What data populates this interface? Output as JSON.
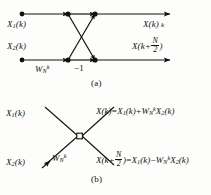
{
  "figure": {
    "type": "fft-butterfly-signal-flow-graph",
    "ink_color": "#111111",
    "background_color": "#fdfdfb"
  },
  "panel_a": {
    "caption": "(a)",
    "inputs": [
      {
        "name": "input-top",
        "base": "X",
        "sub": "1",
        "arg": "(k)"
      },
      {
        "name": "input-bottom",
        "base": "X",
        "sub": "2",
        "arg": "(k)"
      }
    ],
    "outputs": [
      {
        "name": "output-top",
        "base": "X",
        "arg": "(k)",
        "trailing": "k"
      },
      {
        "name": "output-bottom",
        "base": "X",
        "arg_prefix": "(k+",
        "num": "N",
        "den": "2",
        "arg_suffix": ")"
      }
    ],
    "twiddle": {
      "base": "W",
      "sub": "N",
      "sup": "k"
    },
    "minus_one": "−1",
    "nodes": 4
  },
  "panel_b": {
    "caption": "(b)",
    "inputs": [
      {
        "name": "input-top",
        "base": "X",
        "sub": "1",
        "arg": "(k)"
      },
      {
        "name": "input-bottom",
        "base": "X",
        "sub": "2",
        "arg": "(k)"
      }
    ],
    "twiddle": {
      "base": "W",
      "sub": "N",
      "sup": "k"
    },
    "equation_top": {
      "lhs_base": "X",
      "lhs_arg": "(k)",
      "eq": "=",
      "t1_base": "X",
      "t1_sub": "1",
      "t1_arg": "(k)",
      "sign": "+",
      "t2_base": "W",
      "t2_sub": "N",
      "t2_sup": "k",
      "t3_base": "X",
      "t3_sub": "2",
      "t3_arg": "(k)"
    },
    "equation_bottom": {
      "lhs_base": "X",
      "lhs_prefix": "(k+",
      "lhs_num": "N",
      "lhs_den": "2",
      "lhs_suffix": ")",
      "eq": "=",
      "t1_base": "X",
      "t1_sub": "1",
      "t1_arg": "(k)",
      "sign": "−",
      "t2_base": "W",
      "t2_sub": "N",
      "t2_sup": "k",
      "t3_base": "X",
      "t3_sub": "2",
      "t3_arg": "(k)"
    },
    "nodes": 1
  }
}
